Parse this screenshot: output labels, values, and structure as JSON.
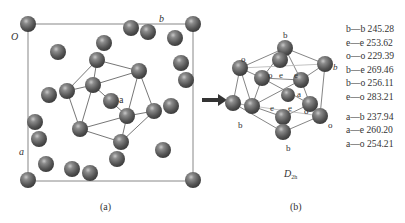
{
  "panel_a": {
    "caption": "(a)",
    "origin_label": "O",
    "axis_b_label": "b",
    "axis_a_label": "a",
    "center_label": "a"
  },
  "arrow": {
    "direction": "right"
  },
  "panel_b": {
    "caption": "(b)",
    "symmetry_label": "D",
    "symmetry_sub": "2h",
    "atom_labels": {
      "b_top": "b",
      "b_bottom": "b",
      "b_left": "b",
      "b_right": "b",
      "o_topleft": "o",
      "o_inner_left": "o",
      "o_inner_right": "o",
      "o_bottom_right": "o",
      "e1": "e",
      "e2": "e",
      "e3": "e",
      "e4": "e",
      "center": "a"
    }
  },
  "distances": {
    "group1": [
      {
        "pair": "b—b",
        "value": "245.28"
      },
      {
        "pair": "e—e",
        "value": "253.62"
      },
      {
        "pair": "o—o",
        "value": "229.39"
      },
      {
        "pair": "b—e",
        "value": "269.46"
      },
      {
        "pair": "b—o",
        "value": "256.11"
      },
      {
        "pair": "e—o",
        "value": "283.21"
      }
    ],
    "group2": [
      {
        "pair": "a—b",
        "value": "237.94"
      },
      {
        "pair": "a—e",
        "value": "260.20"
      },
      {
        "pair": "a—o",
        "value": "254.21"
      }
    ]
  }
}
